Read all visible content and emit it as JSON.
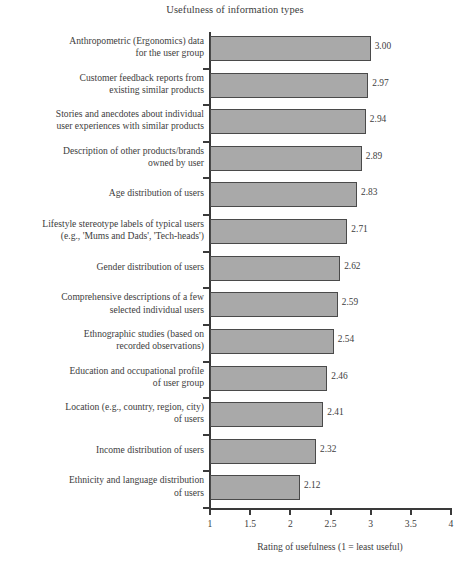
{
  "chart_data": {
    "type": "bar",
    "orientation": "horizontal",
    "title": "Usefulness of information types",
    "xlabel": "Rating of usefulness (1 = least useful)",
    "ylabel": "",
    "xlim": [
      1,
      4
    ],
    "xticks": [
      "1",
      "1.5",
      "2",
      "2.5",
      "3",
      "3.5",
      "4"
    ],
    "xtick_values": [
      1,
      1.5,
      2,
      2.5,
      3,
      3.5,
      4
    ],
    "grid": false,
    "legend": null,
    "bar_color": "#a9a9a9",
    "bar_edge_color": "#4a4a4a",
    "categories": [
      "Anthropometric (Ergonomics) data\nfor the user group",
      "Customer feedback reports from\nexisting similar products",
      "Stories and anecdotes about individual\nuser experiences with similar products",
      "Description of other products/brands\nowned by user",
      "Age distribution of users",
      "Lifestyle stereotype labels of typical users\n(e.g., 'Mums and Dads', 'Tech-heads')",
      "Gender distribution of users",
      "Comprehensive descriptions of a few\nselected individual users",
      "Ethnographic studies (based on\nrecorded observations)",
      "Education and occupational profile\nof user group",
      "Location (e.g., country, region, city)\nof users",
      "Income distribution of users",
      "Ethnicity and language distribution\nof users"
    ],
    "values": [
      3.0,
      2.97,
      2.94,
      2.89,
      2.83,
      2.71,
      2.62,
      2.59,
      2.54,
      2.46,
      2.41,
      2.32,
      2.12
    ],
    "value_labels": [
      "3.00",
      "2.97",
      "2.94",
      "2.89",
      "2.83",
      "2.71",
      "2.62",
      "2.59",
      "2.54",
      "2.46",
      "2.41",
      "2.32",
      "2.12"
    ]
  }
}
